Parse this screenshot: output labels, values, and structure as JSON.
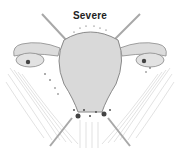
{
  "diagram": {
    "title": "Severe",
    "colors": {
      "organ_fill": "#d9d9d9",
      "organ_stroke": "#8a8a8a",
      "lesion": "#444444",
      "ligament": "#bdbdbd"
    }
  }
}
